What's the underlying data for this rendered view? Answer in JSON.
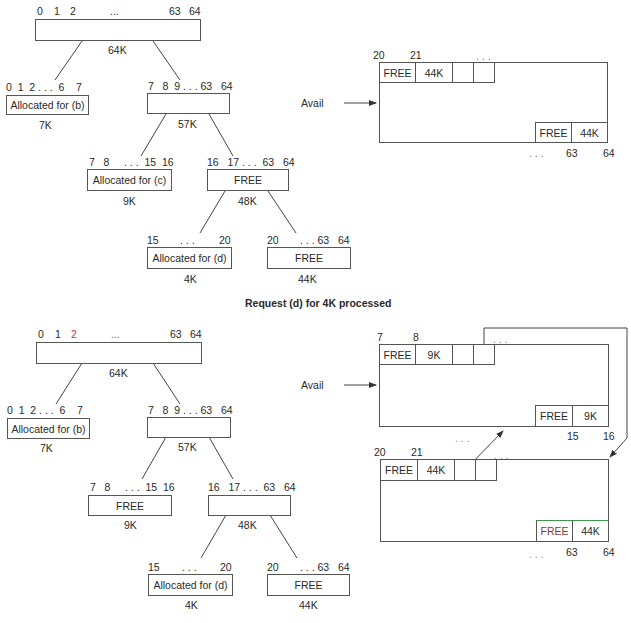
{
  "caption": "Request (d) for 4K processed",
  "avail_label": "Avail",
  "top_tree": {
    "root": {
      "addr": [
        "0",
        "1",
        "2",
        "...",
        "63",
        "64"
      ],
      "size": "64K",
      "label": ""
    },
    "left": {
      "addr": "0  1  2 . . .  6    7",
      "label": "Allocated for (b)",
      "size": "7K"
    },
    "right": {
      "addr": "7   8  9 . . . 63   64",
      "label": "",
      "size": "57K"
    },
    "rl": {
      "addr": "7   8     . . .  15  16",
      "label": "Allocated for (c)",
      "size": "9K"
    },
    "rr": {
      "addr": "16   17 . . .  63   64",
      "label": "FREE",
      "size": "48K"
    },
    "rrl": {
      "addr_left": "15",
      "addr_mid": ". . .",
      "addr_right": "20",
      "label": "Allocated for (d)",
      "size": "4K"
    },
    "rrr": {
      "addr_left": "20",
      "addr_right": ". . . 63   64",
      "label": "FREE",
      "size": "44K"
    }
  },
  "top_list": {
    "addr_20": "20",
    "addr_21": "21",
    "dots_top": ". . .",
    "head_cells": [
      "FREE",
      "44K"
    ],
    "tail_cells": [
      "FREE",
      "44K"
    ],
    "dots_bottom": ". . .",
    "addr_63": "63",
    "addr_64": "64"
  },
  "bottom_tree": {
    "root": {
      "addr": [
        "0",
        "1",
        "2",
        "...",
        "63",
        "64"
      ],
      "size": "64K",
      "label": ""
    },
    "left": {
      "addr": "0  1  2 . . .  6    7",
      "label": "Allocated for (b)",
      "size": "7K"
    },
    "right": {
      "addr": "7   8  9 . . . 63   64",
      "label": "",
      "size": "57K"
    },
    "rl": {
      "addr": "7   8     . . .  15  16",
      "label": "FREE",
      "size": "9K"
    },
    "rr": {
      "addr": "16   17 . . .  63   64",
      "label": "",
      "size": "48K"
    },
    "rrl": {
      "addr_left": "15",
      "addr_mid": ". . .",
      "addr_right": "20",
      "label": "Allocated for (d)",
      "size": "4K"
    },
    "rrr": {
      "addr_left": "20",
      "addr_right": ". . . 63   64",
      "label": "FREE",
      "size": "44K"
    }
  },
  "bottom_list_a": {
    "addr_7": "7",
    "addr_8": "8",
    "dots_top": ". . .",
    "head_cells": [
      "FREE",
      "9K"
    ],
    "tail_cells": [
      "FREE",
      "9K"
    ],
    "dots_bottom": ". . .",
    "addr_15": "15",
    "addr_16": "16"
  },
  "bottom_list_b": {
    "addr_20": "20",
    "addr_21": "21",
    "dots_top": ". . .",
    "head_cells": [
      "FREE",
      "44K"
    ],
    "tail_cells": [
      "FREE",
      "44K"
    ],
    "dots_bottom": ". . .",
    "addr_63": "63",
    "addr_64": "64"
  }
}
